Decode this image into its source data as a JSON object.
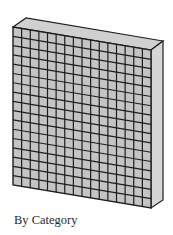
{
  "figure": {
    "caption": "By Category",
    "grid": {
      "columns": 16,
      "rows": 17
    },
    "colors": {
      "face": "#c4c4c4",
      "side": "#d6d6d6",
      "top": "#d0d0d0",
      "lines": "#1e1e1e"
    }
  }
}
